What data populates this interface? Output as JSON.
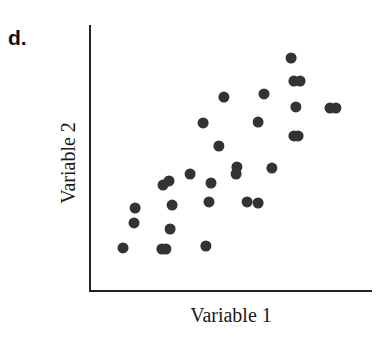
{
  "panel_label": "d.",
  "chart_data": {
    "type": "scatter",
    "title": "",
    "xlabel": "Variable 1",
    "ylabel": "Variable 2",
    "xlim": [
      0,
      100
    ],
    "ylim": [
      0,
      100
    ],
    "grid": false,
    "ticks": false,
    "legend": null,
    "marker_color": "#333333",
    "axis_color": "#222222",
    "points": [
      {
        "x": 71.3,
        "y": 87.6
      },
      {
        "x": 72.3,
        "y": 78.9
      },
      {
        "x": 74.5,
        "y": 78.9
      },
      {
        "x": 47.5,
        "y": 72.9
      },
      {
        "x": 61.7,
        "y": 74.1
      },
      {
        "x": 73.0,
        "y": 69.2
      },
      {
        "x": 85.1,
        "y": 68.8
      },
      {
        "x": 87.2,
        "y": 68.8
      },
      {
        "x": 40.1,
        "y": 63.2
      },
      {
        "x": 59.6,
        "y": 63.5
      },
      {
        "x": 72.3,
        "y": 58.3
      },
      {
        "x": 73.8,
        "y": 58.3
      },
      {
        "x": 45.7,
        "y": 54.5
      },
      {
        "x": 52.1,
        "y": 46.6
      },
      {
        "x": 51.8,
        "y": 44.0
      },
      {
        "x": 64.5,
        "y": 46.2
      },
      {
        "x": 35.5,
        "y": 44.0
      },
      {
        "x": 25.9,
        "y": 39.8
      },
      {
        "x": 28.0,
        "y": 41.4
      },
      {
        "x": 42.9,
        "y": 40.6
      },
      {
        "x": 16.0,
        "y": 31.2
      },
      {
        "x": 29.1,
        "y": 32.3
      },
      {
        "x": 42.2,
        "y": 33.5
      },
      {
        "x": 55.7,
        "y": 33.5
      },
      {
        "x": 59.6,
        "y": 33.1
      },
      {
        "x": 15.6,
        "y": 25.6
      },
      {
        "x": 28.4,
        "y": 23.3
      },
      {
        "x": 11.7,
        "y": 16.2
      },
      {
        "x": 25.5,
        "y": 15.8
      },
      {
        "x": 26.9,
        "y": 15.8
      },
      {
        "x": 41.1,
        "y": 16.9
      }
    ]
  }
}
